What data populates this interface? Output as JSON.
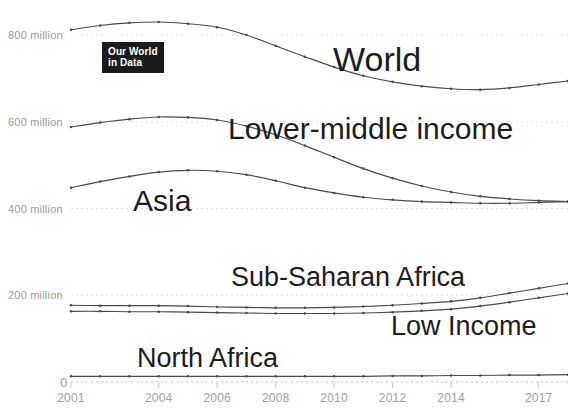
{
  "logo": {
    "line1": "Our World",
    "line2": "in Data"
  },
  "axes": {
    "y_ticks": [
      {
        "label": "800 million",
        "value": 800
      },
      {
        "label": "600 million",
        "value": 600
      },
      {
        "label": "400 million",
        "value": 400
      },
      {
        "label": "200 million",
        "value": 200
      },
      {
        "label": "0",
        "value": 0
      }
    ],
    "x_ticks": [
      {
        "label": "2001",
        "value": 2001
      },
      {
        "label": "2004",
        "value": 2004
      },
      {
        "label": "2006",
        "value": 2006
      },
      {
        "label": "2008",
        "value": 2008
      },
      {
        "label": "2010",
        "value": 2010
      },
      {
        "label": "2012",
        "value": 2012
      },
      {
        "label": "2014",
        "value": 2014
      },
      {
        "label": "2017",
        "value": 2017
      }
    ]
  },
  "series_labels": {
    "world": "World",
    "lower_middle_income": "Lower-middle income",
    "asia": "Asia",
    "sub_saharan_africa": "Sub-Saharan Africa",
    "low_income": "Low Income",
    "north_africa": "North Africa"
  },
  "chart_data": {
    "type": "line",
    "title": "",
    "xlabel": "",
    "ylabel": "",
    "xlim": [
      2001,
      2018
    ],
    "ylim": [
      0,
      830
    ],
    "grid": true,
    "legend": "inline-labels",
    "x": [
      2001,
      2002,
      2003,
      2004,
      2005,
      2006,
      2007,
      2008,
      2009,
      2010,
      2011,
      2012,
      2013,
      2014,
      2015,
      2016,
      2017,
      2018
    ],
    "series": [
      {
        "name": "World",
        "color": "#4a4a4a",
        "values": [
          812,
          822,
          828,
          830,
          826,
          818,
          800,
          775,
          750,
          726,
          706,
          692,
          682,
          676,
          674,
          678,
          686,
          694
        ]
      },
      {
        "name": "Lower-middle income",
        "color": "#4a4a4a",
        "values": [
          588,
          598,
          606,
          611,
          610,
          604,
          590,
          570,
          545,
          518,
          492,
          470,
          452,
          438,
          428,
          422,
          418,
          416
        ]
      },
      {
        "name": "Asia",
        "color": "#4a4a4a",
        "values": [
          448,
          462,
          474,
          484,
          488,
          486,
          478,
          464,
          448,
          436,
          426,
          420,
          416,
          414,
          412,
          412,
          414,
          416
        ]
      },
      {
        "name": "Sub-Saharan Africa",
        "color": "#4a4a4a",
        "values": [
          177,
          176,
          176,
          176,
          175,
          173,
          172,
          171,
          171,
          172,
          174,
          177,
          181,
          186,
          194,
          205,
          216,
          227
        ]
      },
      {
        "name": "Low Income",
        "color": "#4a4a4a",
        "values": [
          163,
          163,
          162,
          162,
          161,
          160,
          159,
          158,
          158,
          158,
          159,
          161,
          164,
          168,
          175,
          184,
          194,
          204
        ]
      },
      {
        "name": "North Africa",
        "color": "#4a4a4a",
        "values": [
          13,
          13,
          13,
          13,
          13,
          13,
          13,
          13,
          13,
          13,
          13,
          14,
          14,
          15,
          15,
          16,
          16,
          17
        ]
      }
    ]
  }
}
